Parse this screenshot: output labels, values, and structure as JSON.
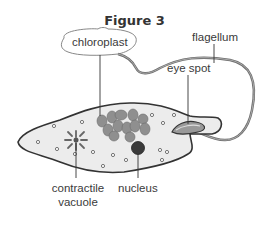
{
  "figure": {
    "title": "Figure 3"
  },
  "labels": {
    "chloroplast": "chloroplast",
    "flagellum": "flagellum",
    "eye_spot": "eye spot",
    "contractile_vacuole_line1": "contractile",
    "contractile_vacuole_line2": "vacuole",
    "nucleus": "nucleus"
  },
  "colors": {
    "body_fill": "#ececec",
    "outline": "#333333",
    "chloroplast_fill": "#8f8f8f",
    "nucleus_fill": "#3a3a3a",
    "flagellum": "#777777",
    "label_text": "#3a3a3a"
  }
}
